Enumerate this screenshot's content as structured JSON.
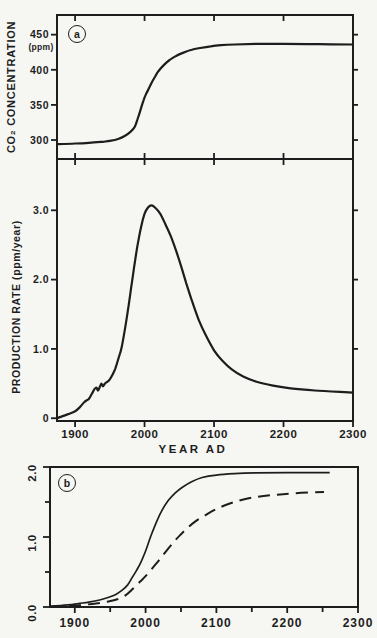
{
  "figure": {
    "panel_a_letter": "a",
    "panel_b_letter": "b",
    "background": "#f6f6f3",
    "ink": "#1d1d1d"
  },
  "chart_data": [
    {
      "id": "co2_concentration",
      "type": "line",
      "panel": "a",
      "title": "",
      "ylabel": "CO₂ CONCENTRATION",
      "ylabel_units": "(ppm)",
      "xlabel": "",
      "xlim": [
        1874,
        2300
      ],
      "ylim": [
        273,
        478
      ],
      "grid": false,
      "yticks": [
        300,
        350,
        400,
        450
      ],
      "ytick_labels": [
        "300",
        "350",
        "400",
        "450"
      ],
      "xticks": [
        1900,
        2000,
        2100,
        2200,
        2300
      ],
      "xtick_labels": [
        "1900",
        "2000",
        "2100",
        "2200",
        "2300"
      ],
      "series": [
        {
          "name": "co2_concentration_ppm",
          "style": "solid",
          "points": [
            [
              1874,
              294
            ],
            [
              1900,
              295
            ],
            [
              1920,
              296
            ],
            [
              1940,
              297.5
            ],
            [
              1952,
              299
            ],
            [
              1962,
              301.5
            ],
            [
              1972,
              306
            ],
            [
              1980,
              312
            ],
            [
              1986,
              319
            ],
            [
              1990,
              330
            ],
            [
              1993,
              339
            ],
            [
              1996,
              349
            ],
            [
              1999,
              358
            ],
            [
              2002,
              365
            ],
            [
              2006,
              373
            ],
            [
              2010,
              381
            ],
            [
              2015,
              390
            ],
            [
              2020,
              398
            ],
            [
              2028,
              407
            ],
            [
              2036,
              414
            ],
            [
              2046,
              420
            ],
            [
              2056,
              424.5
            ],
            [
              2068,
              428.5
            ],
            [
              2080,
              431
            ],
            [
              2095,
              433.5
            ],
            [
              2110,
              435
            ],
            [
              2130,
              436
            ],
            [
              2160,
              436.8
            ],
            [
              2200,
              437
            ],
            [
              2250,
              436.5
            ],
            [
              2300,
              436
            ]
          ]
        }
      ]
    },
    {
      "id": "production_rate",
      "type": "line",
      "panel": "a",
      "title": "",
      "ylabel": "PRODUCTION RATE (ppm/year)",
      "xlabel": "YEAR AD",
      "xlim": [
        1874,
        2300
      ],
      "ylim": [
        -0.04,
        3.74
      ],
      "grid": false,
      "yticks": [
        0,
        1.0,
        2.0,
        3.0
      ],
      "ytick_labels": [
        "0",
        "1.0",
        "2.0",
        "3.0"
      ],
      "yticks_right": [
        1.0,
        2.0,
        3.0
      ],
      "xticks": [
        1900,
        2000,
        2100,
        2200,
        2300
      ],
      "xtick_labels": [
        "1900",
        "2000",
        "2100",
        "2200",
        "2300"
      ],
      "series": [
        {
          "name": "production_rate_ppm_per_year",
          "style": "solid",
          "points": [
            [
              1874,
              0.0
            ],
            [
              1882,
              0.03
            ],
            [
              1890,
              0.06
            ],
            [
              1900,
              0.1
            ],
            [
              1907,
              0.16
            ],
            [
              1913,
              0.23
            ],
            [
              1917,
              0.26
            ],
            [
              1920,
              0.28
            ],
            [
              1924,
              0.35
            ],
            [
              1928,
              0.42
            ],
            [
              1931,
              0.44
            ],
            [
              1933,
              0.4
            ],
            [
              1936,
              0.46
            ],
            [
              1938,
              0.5
            ],
            [
              1940,
              0.46
            ],
            [
              1943,
              0.5
            ],
            [
              1947,
              0.53
            ],
            [
              1950,
              0.56
            ],
            [
              1954,
              0.63
            ],
            [
              1958,
              0.72
            ],
            [
              1963,
              0.88
            ],
            [
              1967,
              1.02
            ],
            [
              1972,
              1.3
            ],
            [
              1977,
              1.62
            ],
            [
              1981,
              1.9
            ],
            [
              1985,
              2.18
            ],
            [
              1990,
              2.5
            ],
            [
              1995,
              2.76
            ],
            [
              2000,
              2.95
            ],
            [
              2005,
              3.04
            ],
            [
              2010,
              3.07
            ],
            [
              2015,
              3.04
            ],
            [
              2022,
              2.96
            ],
            [
              2030,
              2.8
            ],
            [
              2038,
              2.62
            ],
            [
              2046,
              2.4
            ],
            [
              2053,
              2.18
            ],
            [
              2060,
              1.95
            ],
            [
              2068,
              1.7
            ],
            [
              2078,
              1.42
            ],
            [
              2088,
              1.2
            ],
            [
              2100,
              0.98
            ],
            [
              2112,
              0.83
            ],
            [
              2126,
              0.7
            ],
            [
              2142,
              0.6
            ],
            [
              2160,
              0.53
            ],
            [
              2185,
              0.47
            ],
            [
              2210,
              0.43
            ],
            [
              2245,
              0.4
            ],
            [
              2300,
              0.37
            ]
          ]
        }
      ]
    },
    {
      "id": "panel_b",
      "type": "line",
      "panel": "b",
      "title": "",
      "ylabel": "",
      "xlabel": "",
      "xlim": [
        1865,
        2300
      ],
      "ylim": [
        0,
        2.0
      ],
      "grid": false,
      "yticks": [
        0.0,
        1.0,
        2.0
      ],
      "ytick_labels": [
        "0.0",
        "1.0",
        "2.0"
      ],
      "yticks_minor": [
        0.5,
        1.5
      ],
      "xticks": [
        1900,
        2000,
        2100,
        2200,
        2300
      ],
      "xtick_labels": [
        "1900",
        "2000",
        "2100",
        "2200",
        "2300"
      ],
      "xticks_minor": [
        1950,
        2050,
        2150,
        2250
      ],
      "series": [
        {
          "name": "upper_solid_curve",
          "style": "solid",
          "points": [
            [
              1865,
              0.01
            ],
            [
              1890,
              0.03
            ],
            [
              1905,
              0.05
            ],
            [
              1920,
              0.07
            ],
            [
              1935,
              0.1
            ],
            [
              1948,
              0.14
            ],
            [
              1958,
              0.18
            ],
            [
              1967,
              0.24
            ],
            [
              1975,
              0.32
            ],
            [
              1981,
              0.42
            ],
            [
              1987,
              0.52
            ],
            [
              1993,
              0.63
            ],
            [
              2000,
              0.8
            ],
            [
              2007,
              1.0
            ],
            [
              2014,
              1.18
            ],
            [
              2022,
              1.36
            ],
            [
              2032,
              1.52
            ],
            [
              2042,
              1.63
            ],
            [
              2052,
              1.71
            ],
            [
              2065,
              1.79
            ],
            [
              2080,
              1.85
            ],
            [
              2100,
              1.885
            ],
            [
              2125,
              1.905
            ],
            [
              2155,
              1.915
            ],
            [
              2200,
              1.92
            ],
            [
              2260,
              1.92
            ]
          ]
        },
        {
          "name": "lower_dashed_curve",
          "style": "dashed",
          "points": [
            [
              1865,
              0.005
            ],
            [
              1890,
              0.015
            ],
            [
              1910,
              0.03
            ],
            [
              1930,
              0.05
            ],
            [
              1948,
              0.08
            ],
            [
              1960,
              0.11
            ],
            [
              1972,
              0.17
            ],
            [
              1982,
              0.26
            ],
            [
              1992,
              0.36
            ],
            [
              2000,
              0.44
            ],
            [
              2010,
              0.56
            ],
            [
              2020,
              0.68
            ],
            [
              2030,
              0.81
            ],
            [
              2040,
              0.93
            ],
            [
              2048,
              1.02
            ],
            [
              2058,
              1.12
            ],
            [
              2070,
              1.22
            ],
            [
              2084,
              1.31
            ],
            [
              2098,
              1.39
            ],
            [
              2114,
              1.46
            ],
            [
              2132,
              1.52
            ],
            [
              2155,
              1.57
            ],
            [
              2180,
              1.6
            ],
            [
              2210,
              1.625
            ],
            [
              2252,
              1.645
            ]
          ]
        }
      ]
    }
  ]
}
